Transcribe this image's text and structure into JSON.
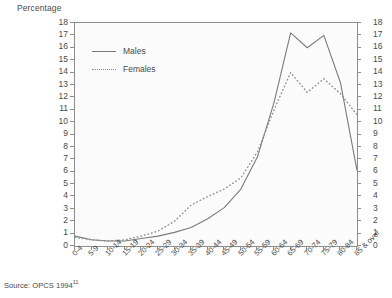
{
  "figure": {
    "y_axis_title": "Percentage",
    "source_text": "Source: OPCS 1994",
    "source_superscript": "11"
  },
  "legend": {
    "position": "inside-top-left",
    "entries": [
      {
        "label": "Males",
        "style": "solid",
        "color": "#7b7b7b"
      },
      {
        "label": "Females",
        "style": "dotted",
        "color": "#8e8e8e"
      }
    ]
  },
  "chart_data": {
    "type": "line",
    "title": "",
    "subtitle": "",
    "xlabel": "",
    "ylabel": "Percentage",
    "ylim": [
      0,
      18
    ],
    "ytick_step": 1,
    "yticks": [
      0,
      1,
      2,
      3,
      4,
      5,
      6,
      7,
      8,
      9,
      10,
      11,
      12,
      13,
      14,
      15,
      16,
      17,
      18
    ],
    "dual_y_axis": true,
    "grid": false,
    "legend_position": "inside-top-left",
    "categories": [
      "0-4",
      "5-9",
      "10-14",
      "15-19",
      "20-24",
      "25-29",
      "30-34",
      "35-39",
      "40-44",
      "45-49",
      "50-54",
      "55-59",
      "60-64",
      "65-69",
      "70-74",
      "75-79",
      "80-84",
      "85 & over"
    ],
    "series": [
      {
        "name": "Males",
        "style": "solid",
        "color": "#7b7b7b",
        "values": [
          0.8,
          0.5,
          0.4,
          0.4,
          0.6,
          0.8,
          1.1,
          1.5,
          2.2,
          3.1,
          4.6,
          7.2,
          11.6,
          17.2,
          16.0,
          17.0,
          13.2,
          6.1
        ]
      },
      {
        "name": "Females",
        "style": "dotted",
        "color": "#8e8e8e",
        "values": [
          0.7,
          0.5,
          0.4,
          0.5,
          0.8,
          1.2,
          2.0,
          3.3,
          4.0,
          4.6,
          5.5,
          7.6,
          11.0,
          14.0,
          12.4,
          13.5,
          12.3,
          10.6
        ]
      }
    ]
  }
}
